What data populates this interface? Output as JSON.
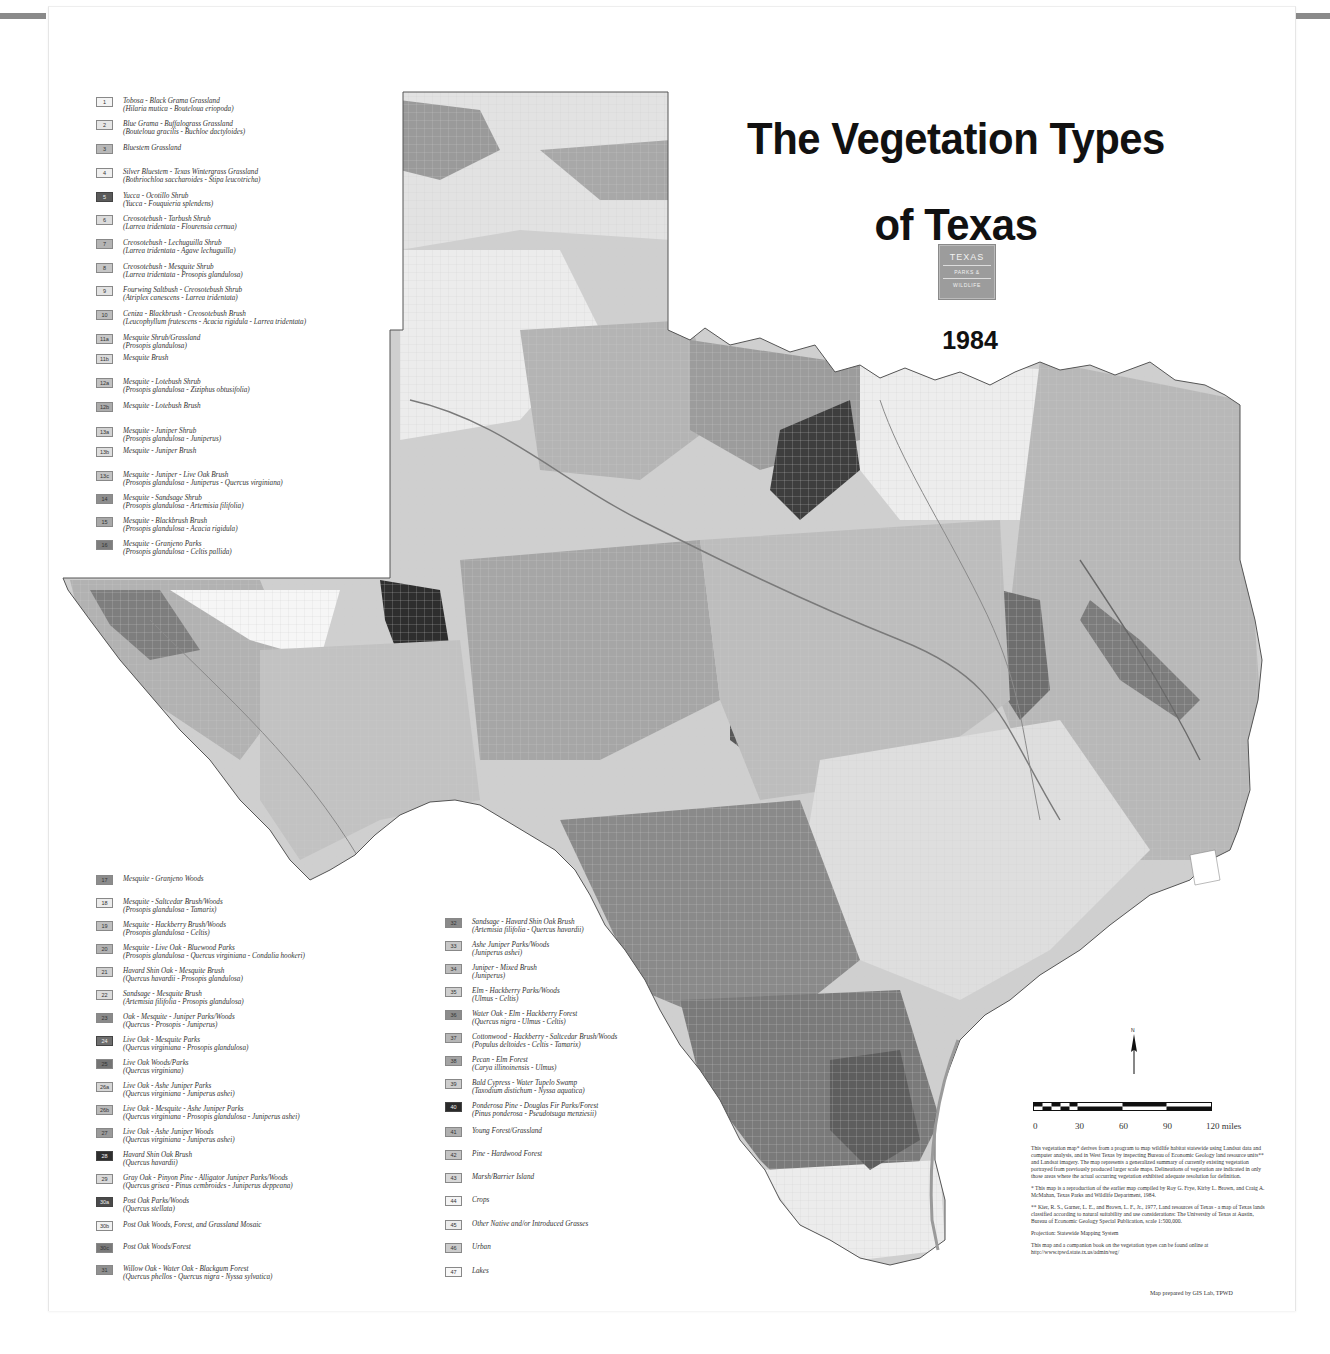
{
  "title": {
    "line1": "The Vegetation Types",
    "line2": "of Texas",
    "year": "1984"
  },
  "logo": {
    "line1": "TEXAS",
    "line2": "PARKS &",
    "line3": "WILDLIFE"
  },
  "legend_top_left": [
    {
      "code": "1",
      "name": "Tobosa - Black Grama Grassland",
      "sci": "(Hilaria mutica - Bouteloua eriopoda)",
      "color": "#f4f4f4"
    },
    {
      "code": "2",
      "name": "Blue Grama - Buffalograss Grassland",
      "sci": "(Bouteloua gracilis - Buchloe dactyloides)",
      "color": "#e6e6e6"
    },
    {
      "code": "3",
      "name": "Bluestem Grassland",
      "sci": "",
      "color": "#b8b8b8"
    },
    {
      "code": "4",
      "name": "Silver Bluestem - Texas Wintergrass Grassland",
      "sci": "(Bothriochloa saccharoides - Stipa leucotricha)",
      "color": "#f0f0f0"
    },
    {
      "code": "5",
      "name": "Yucca - Ocotillo Shrub",
      "sci": "(Yucca - Fouquieria splendens)",
      "color": "#5a5a5a"
    },
    {
      "code": "6",
      "name": "Creosotebush - Tarbush Shrub",
      "sci": "(Larrea tridentata - Flourensia cernua)",
      "color": "#dcdcdc"
    },
    {
      "code": "7",
      "name": "Creosotebush - Lechuguilla Shrub",
      "sci": "(Larrea tridentata - Agave lechuguilla)",
      "color": "#b4b4b4"
    },
    {
      "code": "8",
      "name": "Creosotebush - Mesquite Shrub",
      "sci": "(Larrea tridentata - Prosopis glandulosa)",
      "color": "#c6c6c6"
    },
    {
      "code": "9",
      "name": "Fourwing Saltbush - Creosotebush Shrub",
      "sci": "(Atriplex canescens - Larrea tridentata)",
      "color": "#e2e2e2"
    },
    {
      "code": "10",
      "name": "Ceniza - Blackbrush - Creosotebush Brush",
      "sci": "(Leucophyllum frutescens - Acacia rigidula - Larrea tridentata)",
      "color": "#bdbdbd"
    },
    {
      "code": "11a",
      "name": "Mesquite Shrub/Grassland",
      "sci": "(Prosopis glandulosa)",
      "color": "#c8c8c8"
    },
    {
      "code": "11b",
      "name": "Mesquite Brush",
      "sci": "",
      "color": "#dadada"
    },
    {
      "code": "12a",
      "name": "Mesquite - Lotebush Shrub",
      "sci": "(Prosopis glandulosa - Ziziphus obtusifolia)",
      "color": "#c2c2c2"
    },
    {
      "code": "12b",
      "name": "Mesquite - Lotebush Brush",
      "sci": "",
      "color": "#acacac"
    },
    {
      "code": "13a",
      "name": "Mesquite - Juniper Shrub",
      "sci": "(Prosopis glandulosa - Juniperus)",
      "color": "#d2d2d2"
    },
    {
      "code": "13b",
      "name": "Mesquite - Juniper Brush",
      "sci": "",
      "color": "#dedede"
    },
    {
      "code": "13c",
      "name": "Mesquite - Juniper - Live Oak Brush",
      "sci": "(Prosopis glandulosa - Juniperus - Quercus virginiana)",
      "color": "#c4c4c4"
    },
    {
      "code": "14",
      "name": "Mesquite - Sandsage Shrub",
      "sci": "(Prosopis glandulosa - Artemisia filifolia)",
      "color": "#8e8e8e"
    },
    {
      "code": "15",
      "name": "Mesquite - Blackbrush Brush",
      "sci": "(Prosopis glandulosa - Acacia rigidula)",
      "color": "#a8a8a8"
    },
    {
      "code": "16",
      "name": "Mesquite - Granjeno Parks",
      "sci": "(Prosopis glandulosa - Celtis pallida)",
      "color": "#7e7e7e"
    }
  ],
  "legend_bottom_left": [
    {
      "code": "17",
      "name": "Mesquite - Granjeno Woods",
      "sci": "",
      "color": "#8c8c8c"
    },
    {
      "code": "18",
      "name": "Mesquite - Saltcedar Brush/Woods",
      "sci": "(Prosopis glandulosa - Tamarix)",
      "color": "#ececec"
    },
    {
      "code": "19",
      "name": "Mesquite - Hackberry Brush/Woods",
      "sci": "(Prosopis glandulosa - Celtis)",
      "color": "#c0c0c0"
    },
    {
      "code": "20",
      "name": "Mesquite - Live Oak - Bluewood Parks",
      "sci": "(Prosopis glandulosa - Quercus virginiana - Condalia hookeri)",
      "color": "#b2b2b2"
    },
    {
      "code": "21",
      "name": "Havard Shin Oak - Mesquite Brush",
      "sci": "(Quercus havardii - Prosopis glandulosa)",
      "color": "#d0d0d0"
    },
    {
      "code": "22",
      "name": "Sandsage - Mesquite Brush",
      "sci": "(Artemisia filifolia - Prosopis glandulosa)",
      "color": "#dcdcdc"
    },
    {
      "code": "23",
      "name": "Oak - Mesquite - Juniper Parks/Woods",
      "sci": "(Quercus - Prosopis - Juniperus)",
      "color": "#8a8a8a"
    },
    {
      "code": "24",
      "name": "Live Oak - Mesquite Parks",
      "sci": "(Quercus virginiana - Prosopis glandulosa)",
      "color": "#6e6e6e"
    },
    {
      "code": "25",
      "name": "Live Oak Woods/Parks",
      "sci": "(Quercus virginiana)",
      "color": "#747474"
    },
    {
      "code": "26a",
      "name": "Live Oak - Ashe Juniper Parks",
      "sci": "(Quercus virginiana - Juniperus ashei)",
      "color": "#d6d6d6"
    },
    {
      "code": "26b",
      "name": "Live Oak - Mesquite - Ashe Juniper Parks",
      "sci": "(Quercus virginiana - Prosopis glandulosa - Juniperus ashei)",
      "color": "#bababa"
    },
    {
      "code": "27",
      "name": "Live Oak - Ashe Juniper Woods",
      "sci": "(Quercus virginiana - Juniperus ashei)",
      "color": "#9a9a9a"
    },
    {
      "code": "28",
      "name": "Havard Shin Oak Brush",
      "sci": "(Quercus havardii)",
      "color": "#2e2e2e"
    },
    {
      "code": "29",
      "name": "Gray Oak - Pinyon Pine - Alligator Juniper Parks/Woods",
      "sci": "(Quercus grisea - Pinus cembroides - Juniperus deppeana)",
      "color": "#dadada"
    },
    {
      "code": "30a",
      "name": "Post Oak Parks/Woods",
      "sci": "(Quercus stellata)",
      "color": "#4a4a4a"
    },
    {
      "code": "30b",
      "name": "Post Oak Woods, Forest, and Grassland Mosaic",
      "sci": "",
      "color": "#f2f2f2"
    },
    {
      "code": "30c",
      "name": "Post Oak Woods/Forest",
      "sci": "",
      "color": "#7a7a7a"
    },
    {
      "code": "31",
      "name": "Willow Oak - Water Oak - Blackgum Forest",
      "sci": "(Quercus phellos - Quercus nigra - Nyssa sylvatica)",
      "color": "#909090"
    }
  ],
  "legend_bottom_middle": [
    {
      "code": "32",
      "name": "Sandsage - Havard Shin Oak Brush",
      "sci": "(Artemisia filifolia - Quercus havardii)",
      "color": "#8a8a8a"
    },
    {
      "code": "33",
      "name": "Ashe Juniper Parks/Woods",
      "sci": "(Juniperus ashei)",
      "color": "#c8c8c8"
    },
    {
      "code": "34",
      "name": "Juniper - Mixed Brush",
      "sci": "(Juniperus)",
      "color": "#bcbcbc"
    },
    {
      "code": "35",
      "name": "Elm - Hackberry Parks/Woods",
      "sci": "(Ulmus - Celtis)",
      "color": "#cfcfcf"
    },
    {
      "code": "36",
      "name": "Water Oak - Elm - Hackberry Forest",
      "sci": "(Quercus nigra - Ulmus - Celtis)",
      "color": "#8c8c8c"
    },
    {
      "code": "37",
      "name": "Cottonwood - Hackberry - Saltcedar Brush/Woods",
      "sci": "(Populus deltoides - Celtis - Tamarix)",
      "color": "#b6b6b6"
    },
    {
      "code": "38",
      "name": "Pecan - Elm Forest",
      "sci": "(Carya illinoinensis - Ulmus)",
      "color": "#a4a4a4"
    },
    {
      "code": "39",
      "name": "Bald Cypress - Water Tupelo Swamp",
      "sci": "(Taxodium distichum - Nyssa aquatica)",
      "color": "#cdcdcd"
    },
    {
      "code": "40",
      "name": "Ponderosa Pine - Douglas Fir Parks/Forest",
      "sci": "(Pinus ponderosa - Pseudotsuga menziesii)",
      "color": "#2a2a2a"
    },
    {
      "code": "41",
      "name": "Young Forest/Grassland",
      "sci": "",
      "color": "#b0b0b0"
    },
    {
      "code": "42",
      "name": "Pine - Hardwood Forest",
      "sci": "",
      "color": "#c4c4c4"
    },
    {
      "code": "43",
      "name": "Marsh/Barrier Island",
      "sci": "",
      "color": "#d8d8d8"
    },
    {
      "code": "44",
      "name": "Crops",
      "sci": "",
      "color": "#f4f4f4"
    },
    {
      "code": "45",
      "name": "Other Native and/or Introduced Grasses",
      "sci": "",
      "color": "#ececec"
    },
    {
      "code": "46",
      "name": "Urban",
      "sci": "",
      "color": "#cccccc"
    },
    {
      "code": "47",
      "name": "Lakes",
      "sci": "",
      "color": "#f8f8f8"
    }
  ],
  "scale": {
    "labels": [
      "0",
      "30",
      "60",
      "90",
      "120 miles"
    ]
  },
  "north_arrow": {
    "label": "N"
  },
  "notes": {
    "p1": "This vegetation map* derives from a program to map wildlife habitat statewide using Landsat data and computer analysis, and in West Texas by inspecting Bureau of Economic Geology land resource units** and Landsat imagery. The map represents a generalized summary of currently existing vegetation portrayed from previously produced larger scale maps. Delineations of vegetation are indicated in only those areas where the actual occurring vegetation exhibited adequate resolution for definition.",
    "p2": "* This map is a reproduction of the earlier map compiled by Roy G. Frye, Kirby L. Brown, and Craig A. McMahan, Texas Parks and Wildlife Department, 1984.",
    "p3": "** Kier, R. S., Garner, L. E., and Brown, L. F., Jr., 1977, Land resources of Texas - a map of Texas lands classified according to natural suitability and use considerations: The University of Texas at Austin, Bureau of Economic Geology Special Publication, scale 1:500,000.",
    "p4": "Projection: Statewide Mapping System",
    "p5": "This map and a companion book on the vegetation types can be found online at http://www.tpwd.state.tx.us/admin/veg/"
  },
  "credit": "Map prepared by GIS Lab, TPWD",
  "map_labels": {
    "panhandle": [
      "DALLAM",
      "SHERMAN",
      "HANSFORD",
      "OCHILTREE",
      "LIPSCOMB",
      "HARTLEY",
      "MOORE",
      "HUTCHINSON",
      "ROBERTS",
      "HEMPHILL"
    ],
    "west": [
      "EL PASO",
      "HUDSPETH",
      "CULBERSON",
      "JEFF DAVIS",
      "PRESIDIO",
      "BREWSTER",
      "PECOS",
      "REEVES",
      "LOVING",
      "WINKLER"
    ],
    "central": [
      "LLANO",
      "BURNET",
      "TRAVIS",
      "CROCKETT",
      "TERRELL",
      "VAL VERDE"
    ],
    "east": [
      "GRAYSON",
      "COLLIN",
      "LAMAR",
      "ANDERSON",
      "CHEROKEE",
      "NACOGDOCHES",
      "ANGELINA",
      "TRINITY",
      "POLK",
      "TYLER",
      "JASPER",
      "NEWTON",
      "HARDIN",
      "LIBERTY",
      "CHAMBERS",
      "HARRIS",
      "MONTGOMERY",
      "SAN JACINTO",
      "WALKER",
      "ORANGE",
      "JEFFERSON",
      "GALVESTON",
      "BRAZORIA",
      "MATAGORDA"
    ],
    "south": [
      "DUVAL",
      "JIM WELLS",
      "NUECES",
      "KLEBERG",
      "KENEDY",
      "BROOKS",
      "STARR",
      "HIDALGO",
      "WILLACY",
      "CAMERON",
      "SAN PATRICIO"
    ]
  }
}
